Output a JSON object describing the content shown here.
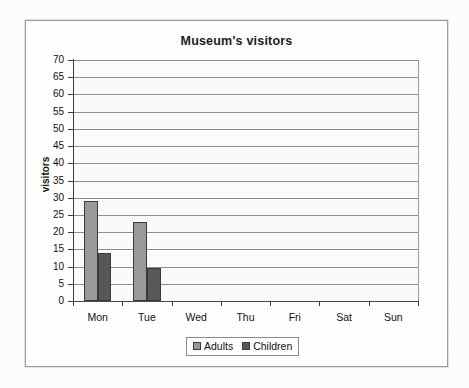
{
  "chart_data": {
    "type": "bar",
    "title": "Museum's visitors",
    "xlabel": "",
    "ylabel": "visitors",
    "categories": [
      "Mon",
      "Tue",
      "Wed",
      "Thu",
      "Fri",
      "Sat",
      "Sun"
    ],
    "series": [
      {
        "name": "Adults",
        "color": "#9a9a9a",
        "values": [
          29,
          23,
          0,
          0,
          0,
          0,
          0
        ]
      },
      {
        "name": "Children",
        "color": "#585858",
        "values": [
          14,
          9.5,
          0,
          0,
          0,
          0,
          0
        ]
      }
    ],
    "ylim": [
      0,
      70
    ],
    "ytick_step": 5,
    "ytick_labels": [
      "70",
      "65",
      "60",
      "55",
      "50",
      "45",
      "40",
      "35",
      "30",
      "25",
      "20",
      "15",
      "10",
      "5",
      "0"
    ],
    "grid": true,
    "grid_orientation": "horizontal",
    "legend_position": "bottom",
    "legend_entries": [
      "Adults",
      "Children"
    ]
  },
  "frame": {
    "background_color": "#ffffff",
    "border_color": "#9d9d9d"
  }
}
